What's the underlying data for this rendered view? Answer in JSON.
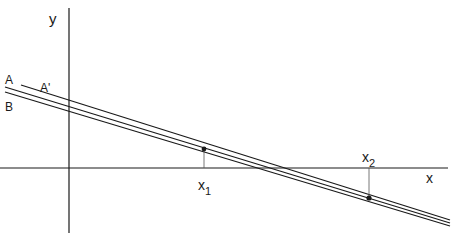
{
  "diagram": {
    "axes": {
      "x_label": "x",
      "y_label": "y"
    },
    "lines": [
      {
        "name": "A",
        "label": "A"
      },
      {
        "name": "A_prime",
        "label": "A'"
      },
      {
        "name": "B",
        "label": "B"
      }
    ],
    "points": [
      {
        "name": "x1",
        "label": "x",
        "subscript": "1"
      },
      {
        "name": "x2",
        "label": "x",
        "subscript": "2"
      }
    ],
    "colors": {
      "ink": "#1a1a1a",
      "background": "#ffffff"
    }
  }
}
